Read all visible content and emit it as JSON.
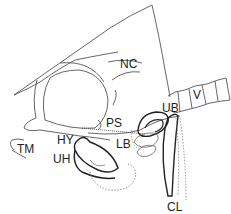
{
  "diagram": {
    "type": "anatomical line drawing (skull, lateral view)",
    "labels": {
      "nc": "NC",
      "v": "V",
      "ub": "UB",
      "ps": "PS",
      "lb": "LB",
      "hy": "HY",
      "uh": "UH",
      "tm": "TM",
      "cl": "CL"
    },
    "colors": {
      "outline": "#555555",
      "bold_outline": "#222222",
      "dotted": "#777777",
      "text": "#222222",
      "background": "#ffffff"
    }
  }
}
